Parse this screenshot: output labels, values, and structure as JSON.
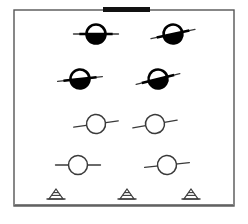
{
  "figure": {
    "type": "line-diagram",
    "width": 248,
    "height": 224,
    "background_color": "#ffffff",
    "stroke_color": "#3a3a3a",
    "fill_color": "#000000"
  },
  "frame": {
    "name": "diagram-border",
    "x": 14,
    "y": 10,
    "width": 220,
    "height": 196,
    "stroke_width": 1.4,
    "color": "#555555"
  },
  "top_bar": {
    "name": "top-black-bar",
    "label": "",
    "x": 103,
    "y": 7,
    "width": 47,
    "height": 5,
    "color": "#111111"
  },
  "ground_line": {
    "name": "ground-baseline",
    "x1": 15,
    "x2": 233,
    "y": 205,
    "color": "#555555",
    "stroke_width": 1.4
  },
  "symbols": {
    "filled_label": "half-filled-circle",
    "open_label": "open-circle",
    "circle_radius": 9.5,
    "line_length": 13,
    "items": [
      {
        "id": "node-1",
        "name": "half-filled-circle-node",
        "fill": "filled",
        "cx": 96,
        "cy": 34,
        "tilt": 0,
        "row": 1,
        "col": 1
      },
      {
        "id": "node-2",
        "name": "half-filled-circle-node",
        "fill": "filled",
        "cx": 173,
        "cy": 34,
        "tilt": -12,
        "row": 1,
        "col": 2
      },
      {
        "id": "node-3",
        "name": "half-filled-circle-node",
        "fill": "filled",
        "cx": 80,
        "cy": 79,
        "tilt": -6,
        "row": 2,
        "col": 1
      },
      {
        "id": "node-4",
        "name": "half-filled-circle-node",
        "fill": "filled",
        "cx": 158,
        "cy": 79,
        "tilt": -14,
        "row": 2,
        "col": 2
      },
      {
        "id": "node-5",
        "name": "open-circle-node",
        "fill": "open",
        "cx": 96,
        "cy": 124,
        "tilt": -8,
        "row": 3,
        "col": 1
      },
      {
        "id": "node-6",
        "name": "open-circle-node",
        "fill": "open",
        "cx": 155,
        "cy": 124,
        "tilt": -10,
        "row": 3,
        "col": 2
      },
      {
        "id": "node-7",
        "name": "open-circle-node",
        "fill": "open",
        "cx": 78,
        "cy": 165,
        "tilt": 0,
        "row": 4,
        "col": 1
      },
      {
        "id": "node-8",
        "name": "open-circle-node",
        "fill": "open",
        "cx": 167,
        "cy": 165,
        "tilt": -6,
        "row": 4,
        "col": 2
      }
    ]
  },
  "ground_markers": {
    "label": "triangle-support-marker",
    "count": 3,
    "items": [
      {
        "id": "support-1",
        "name": "triangle-support-marker",
        "cx": 56,
        "cy": 199,
        "half_width": 7,
        "height": 10
      },
      {
        "id": "support-2",
        "name": "triangle-support-marker",
        "cx": 127,
        "cy": 199,
        "half_width": 7,
        "height": 10
      },
      {
        "id": "support-3",
        "name": "triangle-support-marker",
        "cx": 191,
        "cy": 199,
        "half_width": 7,
        "height": 10
      }
    ]
  }
}
